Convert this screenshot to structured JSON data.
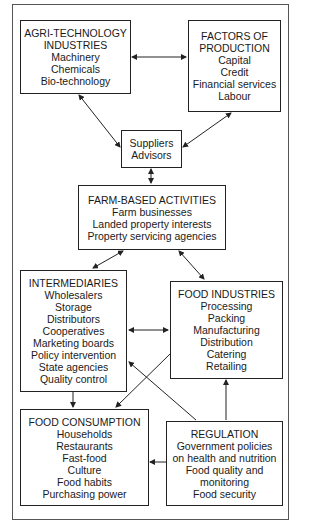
{
  "diagram": {
    "boxes": {
      "agri": {
        "title": [
          "AGRI-TECHNOLOGY",
          "INDUSTRIES"
        ],
        "items": [
          "Machinery",
          "Chemicals",
          "Bio-technology"
        ]
      },
      "factors": {
        "title": [
          "FACTORS OF",
          "PRODUCTION"
        ],
        "items": [
          "Capital",
          "Credit",
          "Financial services",
          "Labour"
        ]
      },
      "suppliers": {
        "title": [],
        "items": [
          "Suppliers",
          "Advisors"
        ]
      },
      "farm": {
        "title": [
          "FARM-BASED ACTIVITIES"
        ],
        "items": [
          "Farm businesses",
          "Landed property interests",
          "Property servicing agencies"
        ]
      },
      "intermediaries": {
        "title": [
          "INTERMEDIARIES"
        ],
        "items": [
          "Wholesalers",
          "Storage",
          "Distributors",
          "Cooperatives",
          "Marketing boards",
          "Policy intervention",
          "State agencies",
          "Quality control"
        ]
      },
      "food_industries": {
        "title": [
          "FOOD INDUSTRIES"
        ],
        "items": [
          "Processing",
          "Packing",
          "Manufacturing",
          "Distribution",
          "Catering",
          "Retailing"
        ]
      },
      "consumption": {
        "title": [
          "FOOD CONSUMPTION"
        ],
        "items": [
          "Households",
          "Restaurants",
          "Fast-food",
          "Culture",
          "Food habits",
          "Purchasing power"
        ]
      },
      "regulation": {
        "title": [
          "REGULATION"
        ],
        "items": [
          "Government policies",
          "on health and nutrition",
          "Food quality and",
          "monitoring",
          "Food security"
        ]
      }
    },
    "edges": [
      {
        "from": "agri",
        "to": "factors",
        "type": "bidirectional"
      },
      {
        "from": "agri",
        "to": "suppliers",
        "type": "bidirectional"
      },
      {
        "from": "factors",
        "to": "suppliers",
        "type": "bidirectional"
      },
      {
        "from": "suppliers",
        "to": "farm",
        "type": "bidirectional"
      },
      {
        "from": "farm",
        "to": "intermediaries",
        "type": "bidirectional"
      },
      {
        "from": "farm",
        "to": "food_industries",
        "type": "bidirectional"
      },
      {
        "from": "intermediaries",
        "to": "food_industries",
        "type": "bidirectional"
      },
      {
        "from": "intermediaries",
        "to": "consumption",
        "type": "directed"
      },
      {
        "from": "food_industries",
        "to": "consumption",
        "type": "directed"
      },
      {
        "from": "regulation",
        "to": "intermediaries",
        "type": "directed"
      },
      {
        "from": "regulation",
        "to": "food_industries",
        "type": "directed"
      },
      {
        "from": "regulation",
        "to": "consumption",
        "type": "directed"
      }
    ]
  }
}
